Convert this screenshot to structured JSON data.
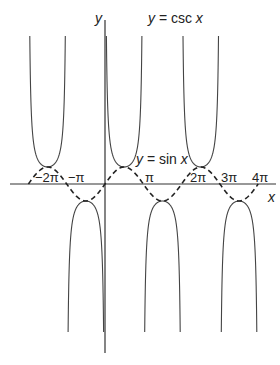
{
  "chart_data": {
    "type": "line",
    "title": "",
    "xlabel": "x",
    "ylabel": "y",
    "x_ticks": [
      "−2π",
      "−π",
      "π",
      "2π",
      "3π",
      "4π"
    ],
    "x_tick_values": [
      -6.2832,
      -3.1416,
      3.1416,
      6.2832,
      9.4248,
      12.5664
    ],
    "xlim": [
      -7.3,
      14.2
    ],
    "ylim": [
      -9.5,
      9.5
    ],
    "grid": false,
    "series": [
      {
        "name": "y = csc x",
        "style": "solid",
        "expression": "1/sin(x)",
        "domain": [
          -6.2832,
          12.5664
        ]
      },
      {
        "name": "y = sin x",
        "style": "dashed",
        "expression": "sin(x)",
        "domain": [
          -6.2832,
          12.5664
        ]
      }
    ],
    "annotations": [
      {
        "text": "y = csc x",
        "near": "top, above branch centered at x=π/2"
      },
      {
        "text": "y = sin x",
        "near": "above peak at x=π/2"
      }
    ]
  },
  "labels": {
    "y_axis": "y",
    "x_axis": "x",
    "csc_label_var": "y",
    "csc_label_rest": " = csc ",
    "csc_label_x": "x",
    "sin_label_var": "y",
    "sin_label_rest": " = sin ",
    "sin_label_x": "x",
    "tick_m2pi": "−2π",
    "tick_mpi": "−π",
    "tick_pi": "π",
    "tick_2pi": "2π",
    "tick_3pi": "3π",
    "tick_4pi": "4π"
  }
}
